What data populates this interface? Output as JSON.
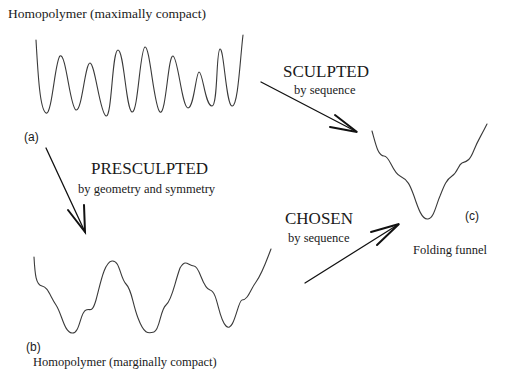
{
  "panels": {
    "a": {
      "label": "(a)",
      "title": "Homopolymer (maximally compact)"
    },
    "b": {
      "label": "(b)",
      "title": "Homopolymer (marginally compact)"
    },
    "c": {
      "label": "(c)",
      "title": "Folding funnel"
    }
  },
  "transitions": {
    "sculpted": {
      "heading": "SCULPTED",
      "subtitle": "by sequence"
    },
    "presculpted": {
      "heading": "PRESCULPTED",
      "subtitle": "by geometry and symmetry"
    },
    "chosen": {
      "heading": "CHOSEN",
      "subtitle": "by sequence"
    }
  },
  "colors": {
    "curve": "#3a3a3a",
    "arrow": "#111111",
    "text": "#1a1a1a",
    "background": "#ffffff"
  }
}
